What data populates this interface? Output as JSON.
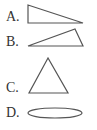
{
  "options": [
    {
      "label": "A.",
      "shape": "right-triangle"
    },
    {
      "label": "B.",
      "shape": "obtuse-triangle"
    },
    {
      "label": "C.",
      "shape": "isosceles-triangle"
    },
    {
      "label": "D.",
      "shape": "ellipse"
    }
  ]
}
